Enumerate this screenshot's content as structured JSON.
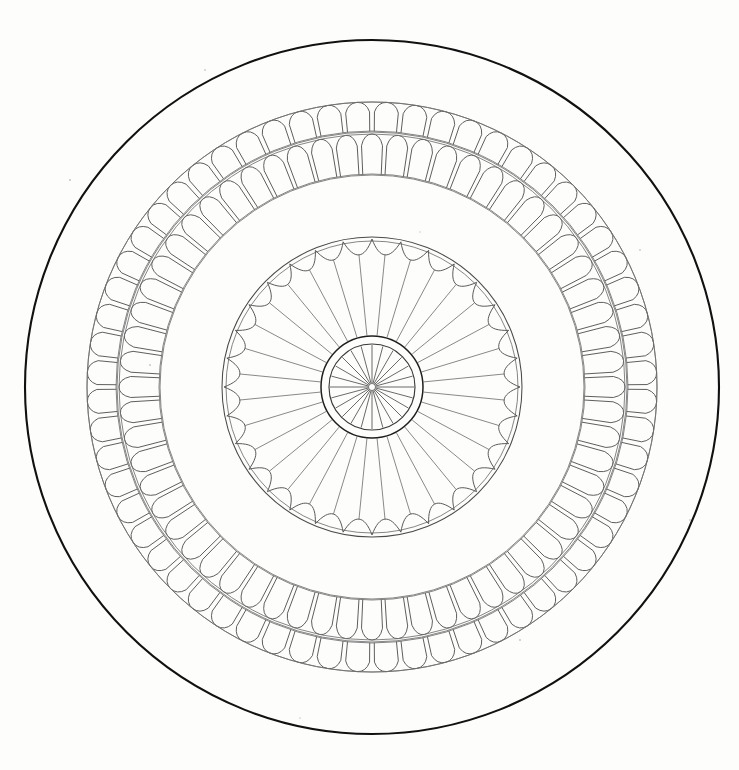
{
  "page": {
    "width": 739,
    "height": 770,
    "background_color": "#fdfdfc",
    "ink_color": "#111111"
  },
  "geometry": {
    "center_x": 372,
    "center_y": 387,
    "units": "pixels"
  },
  "chart_data": {
    "type": "line",
    "xlabel": "",
    "ylabel": "",
    "grid": false,
    "legend_position": "none",
    "categories": [
      "outer-rim",
      "bead-ring-outer-row",
      "bead-ring-inner-row",
      "plain-field",
      "rosette-rim",
      "scallop-band",
      "spoke-field",
      "hub-double-ring",
      "hub-spokes"
    ],
    "values": [
      347,
      285,
      255,
      212,
      150,
      135,
      51,
      51,
      42
    ],
    "ylim": [
      0,
      360
    ]
  },
  "elements": {
    "outer_rim": {
      "name": "Outer rim circle",
      "radius": 347,
      "stroke_width": 2.1,
      "color": "#111111"
    },
    "bead_ring": {
      "name": "Double beaded ring",
      "outer_radius": 285,
      "middle_radius": 255,
      "inner_radius": 212,
      "rows": 2,
      "beads_per_row": 60,
      "bead_shape": "rounded-rectangle-radial",
      "color": "#555555",
      "rows_detail": [
        {
          "label": "outer row",
          "r_out": 285,
          "r_in": 256,
          "count": 60,
          "offset_deg": 0
        },
        {
          "label": "inner row",
          "r_out": 253,
          "r_in": 213,
          "count": 60,
          "offset_deg": 3
        }
      ]
    },
    "plain_field": {
      "name": "Plain annular field",
      "outer_radius": 212,
      "inner_radius": 150,
      "color": "#ffffff"
    },
    "rosette": {
      "name": "Inner rosette",
      "rim_radius": 150,
      "rim_radius_inner": 146,
      "scallop_outer_radius": 148,
      "scallop_inner_radius": 133,
      "scallop_count": 32,
      "spoke_count": 32,
      "spoke_outer_radius": 133,
      "spoke_inner_radius": 52,
      "color": "#5a5a5a"
    },
    "hub": {
      "name": "Central hub",
      "outer_ring_radius": 51,
      "inner_ring_radius": 43,
      "spoke_count": 24,
      "spoke_outer_radius": 42,
      "spoke_inner_radius": 3,
      "color": "#1f1f1f"
    }
  },
  "specks": [
    {
      "x": 70,
      "y": 180,
      "r": 1.1
    },
    {
      "x": 205,
      "y": 70,
      "r": 0.9
    },
    {
      "x": 150,
      "y": 365,
      "r": 1.0
    },
    {
      "x": 640,
      "y": 250,
      "r": 0.9
    },
    {
      "x": 520,
      "y": 640,
      "r": 1.0
    },
    {
      "x": 300,
      "y": 718,
      "r": 0.8
    },
    {
      "x": 690,
      "y": 520,
      "r": 0.9
    },
    {
      "x": 420,
      "y": 232,
      "r": 0.8
    }
  ]
}
